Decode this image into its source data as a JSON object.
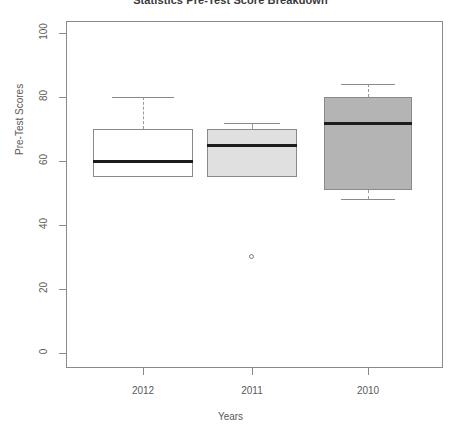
{
  "chart_data": {
    "type": "box",
    "title": "Statistics Pre-Test Score Breakdown",
    "xlabel": "Years",
    "ylabel": "Pre-Test Scores",
    "categories": [
      "2012",
      "2011",
      "2010"
    ],
    "ylim": [
      0,
      100
    ],
    "yticks": [
      0,
      20,
      40,
      60,
      80,
      100
    ],
    "ytick_labels": [
      "0",
      "20",
      "40",
      "60",
      "80",
      "100"
    ],
    "grid": false,
    "legend": "none",
    "boxes": [
      {
        "category": "2012",
        "whisker_low": 55,
        "q1": 55,
        "median": 60,
        "q3": 70,
        "whisker_high": 80,
        "outliers": [],
        "fill": "#ffffff"
      },
      {
        "category": "2011",
        "whisker_low": 55,
        "q1": 55,
        "median": 65,
        "q3": 70,
        "whisker_high": 72,
        "outliers": [
          30
        ],
        "fill": "#e0e0e0"
      },
      {
        "category": "2010",
        "whisker_low": 48,
        "q1": 51,
        "median": 72,
        "q3": 80,
        "whisker_high": 84,
        "outliers": [],
        "fill": "#b4b4b4"
      }
    ],
    "colors": {
      "frame": "#8a8a8a",
      "median": "#1c1c1c",
      "text": "#5a5a5a",
      "background": "#ffffff"
    }
  }
}
